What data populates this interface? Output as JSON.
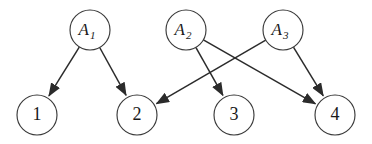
{
  "diagram": {
    "type": "directed-bipartite-graph",
    "title": "",
    "background_color": "#ffffff",
    "node_stroke_color": "#3a3a3a",
    "edge_color": "#2b2b2b",
    "label_color": "#1a1a1a",
    "node_radius": 20,
    "nodes": [
      {
        "id": "A1",
        "label": "A",
        "subscript": "1",
        "style": "factor",
        "cx": 90,
        "cy": 30
      },
      {
        "id": "A2",
        "label": "A",
        "subscript": "2",
        "style": "factor",
        "cx": 186,
        "cy": 30
      },
      {
        "id": "A3",
        "label": "A",
        "subscript": "3",
        "style": "factor",
        "cx": 283,
        "cy": 30
      },
      {
        "id": "N1",
        "label": "1",
        "subscript": "",
        "style": "variable",
        "cx": 37,
        "cy": 115
      },
      {
        "id": "N2",
        "label": "2",
        "subscript": "",
        "style": "variable",
        "cx": 137,
        "cy": 115
      },
      {
        "id": "N3",
        "label": "3",
        "subscript": "",
        "style": "variable",
        "cx": 234,
        "cy": 115
      },
      {
        "id": "N4",
        "label": "4",
        "subscript": "",
        "style": "variable",
        "cx": 335,
        "cy": 115
      }
    ],
    "edges": [
      {
        "from": "A1",
        "to": "N1"
      },
      {
        "from": "A1",
        "to": "N2"
      },
      {
        "from": "A2",
        "to": "N3"
      },
      {
        "from": "A2",
        "to": "N4"
      },
      {
        "from": "A3",
        "to": "N2"
      },
      {
        "from": "A3",
        "to": "N4"
      }
    ]
  }
}
